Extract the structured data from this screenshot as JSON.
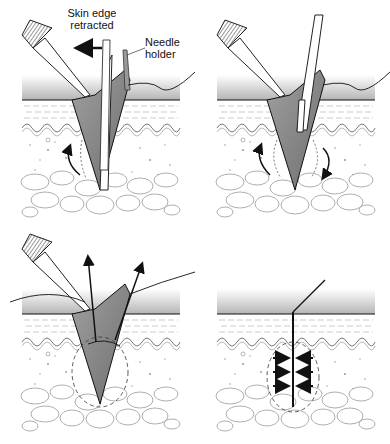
{
  "figure": {
    "panels": [
      {
        "id": "step-1",
        "description": "Needle holder inserting needle while skin edge is retracted with forceps"
      },
      {
        "id": "step-2",
        "description": "Needle advanced through tissue with rotation arrows on both sides"
      },
      {
        "id": "step-3",
        "description": "Suture pulled upward from wound, arrows indicating direction"
      },
      {
        "id": "step-4",
        "description": "Wound closed with arrows showing edges approximated"
      }
    ],
    "labels": {
      "skin_edge_line1": "Skin edge",
      "skin_edge_line2": "retracted",
      "needle_holder_line1": "Needle",
      "needle_holder_line2": "holder"
    },
    "colors": {
      "ink": "#111111",
      "epidermis_shade": "#b8b8b8",
      "wound_fill": "#8c8c8c",
      "fat_line": "#999999",
      "background": "#ffffff"
    }
  }
}
